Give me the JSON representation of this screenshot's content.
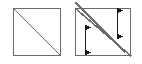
{
  "figure": {
    "type": "line-diagram",
    "background_color": "#ffffff",
    "stroke_color": "#6b6b6b",
    "arrow_color": "#1a1a1a",
    "canvas": {
      "width": 142,
      "height": 64
    },
    "panels": [
      {
        "name": "left-panel",
        "label": "square-with-single-diagonal",
        "square": {
          "x": 13,
          "y": 8,
          "width": 48,
          "height": 48
        },
        "diagonals": [
          {
            "name": "main-diagonal",
            "x1": 13,
            "y1": 8,
            "x2": 61,
            "y2": 56
          }
        ],
        "arrows": []
      },
      {
        "name": "right-panel",
        "label": "square-with-two-diagonals-and-arrows",
        "square": {
          "x": 75,
          "y": 8,
          "width": 56,
          "height": 48
        },
        "diagonals": [
          {
            "name": "upper-diagonal",
            "x1": 75,
            "y1": 2,
            "x2": 125,
            "y2": 52
          },
          {
            "name": "lower-diagonal",
            "x1": 75,
            "y1": 8,
            "x2": 131,
            "y2": 56
          }
        ],
        "arrows": [
          {
            "name": "lower-left-arrow",
            "x": 85,
            "y1": 27,
            "y2": 52,
            "heads": "both"
          },
          {
            "name": "upper-right-arrow",
            "x": 117,
            "y1": 10,
            "y2": 36,
            "heads": "both"
          }
        ]
      }
    ]
  }
}
